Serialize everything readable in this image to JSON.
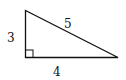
{
  "diagram": {
    "type": "right-triangle",
    "labels": {
      "vertical_leg": "3",
      "hypotenuse": "5",
      "horizontal_leg": "4"
    },
    "right_angle_marker": true,
    "stroke_color": "#111111",
    "background": "#ffffff"
  }
}
